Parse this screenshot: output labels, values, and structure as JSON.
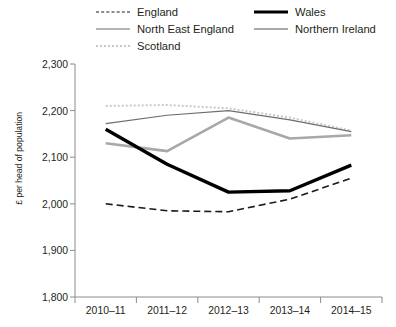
{
  "legend": {
    "columns": [
      {
        "items": [
          {
            "label": "England",
            "key": "england",
            "style": "dashed",
            "color": "#1a1a1a"
          },
          {
            "label": "North East England",
            "key": "ne-england",
            "style": "solid-thin",
            "color": "#6d6d6d"
          },
          {
            "label": "Scotland",
            "key": "scotland",
            "style": "dotted",
            "color": "#c9c9c9"
          }
        ]
      },
      {
        "items": [
          {
            "label": "Wales",
            "key": "wales",
            "style": "solid-thick",
            "color": "#000000"
          },
          {
            "label": "Northern Ireland",
            "key": "northern-ireland",
            "style": "solid-medium",
            "color": "#a8a8a8"
          }
        ]
      }
    ]
  },
  "chart_data": {
    "type": "line",
    "title": "",
    "xlabel": "",
    "ylabel": "£ per head of population",
    "categories": [
      "2010–11",
      "2011–12",
      "2012–13",
      "2013–14",
      "2014–15"
    ],
    "ylim": [
      1800,
      2300
    ],
    "yticks": [
      1800,
      1900,
      2000,
      2100,
      2200,
      2300
    ],
    "ytick_labels": [
      "1,800",
      "1,900",
      "2,000",
      "2,100",
      "2,200",
      "2,300"
    ],
    "grid": false,
    "legend_position": "top",
    "series": [
      {
        "name": "England",
        "color": "#1a1a1a",
        "style": "dashed",
        "width": 1.6,
        "values": [
          2000,
          1985,
          1983,
          2010,
          2055
        ]
      },
      {
        "name": "North East England",
        "color": "#6d6d6d",
        "style": "solid",
        "width": 1.2,
        "values": [
          2172,
          2190,
          2200,
          2180,
          2155
        ]
      },
      {
        "name": "Scotland",
        "color": "#c9c9c9",
        "style": "dotted",
        "width": 2,
        "values": [
          2210,
          2212,
          2205,
          2185,
          2157
        ]
      },
      {
        "name": "Wales",
        "color": "#000000",
        "style": "solid",
        "width": 3.4,
        "values": [
          2160,
          2085,
          2025,
          2028,
          2083
        ]
      },
      {
        "name": "Northern Ireland",
        "color": "#a8a8a8",
        "style": "solid",
        "width": 2.6,
        "values": [
          2130,
          2113,
          2185,
          2140,
          2147
        ]
      }
    ]
  }
}
